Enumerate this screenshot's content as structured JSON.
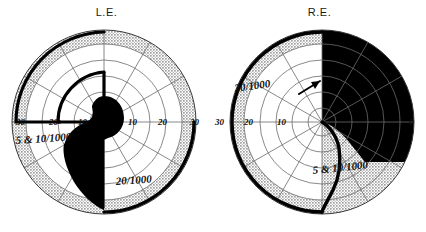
{
  "figure": {
    "kind": "visual-field-perimetry-pair",
    "background_color": "#ffffff",
    "ink_color": "#111111",
    "shade_color": "#c9c9c9",
    "grid_color": "#6b6b6b"
  },
  "panels": [
    {
      "id": "left-eye",
      "title": "L.E.",
      "center": {
        "cx": 104,
        "cy": 100
      },
      "outer_radius": 92,
      "grid": {
        "radial_rings": [
          14,
          30,
          46,
          62,
          78,
          92
        ],
        "meridian_count": 12,
        "shaded_annulus": [
          78,
          92
        ]
      },
      "axis_labels": [
        {
          "text": "30",
          "x": 16,
          "y": 103,
          "side": "left"
        },
        {
          "text": "20",
          "x": 49,
          "y": 103,
          "side": "left"
        },
        {
          "text": "10",
          "x": 78,
          "y": 103,
          "side": "left"
        },
        {
          "text": "10",
          "x": 128,
          "y": 103,
          "side": "right"
        },
        {
          "text": "20",
          "x": 158,
          "y": 103,
          "side": "right"
        },
        {
          "text": "30",
          "x": 190,
          "y": 103,
          "side": "right"
        }
      ],
      "isopter_labels": [
        {
          "text": "5 & 10/1000",
          "x": 16,
          "y": 122,
          "rotate": -4
        },
        {
          "text": "20/1000",
          "x": 116,
          "y": 163,
          "rotate": -4
        }
      ],
      "scotoma_fill": "#000000",
      "has_arrow": false
    },
    {
      "id": "right-eye",
      "title": "R.E.",
      "center": {
        "cx": 109,
        "cy": 100
      },
      "outer_radius": 92,
      "grid": {
        "radial_rings": [
          14,
          30,
          46,
          62,
          78,
          92
        ],
        "meridian_count": 12,
        "shaded_annulus": [
          78,
          92
        ]
      },
      "axis_labels": [
        {
          "text": "30",
          "x": 2,
          "y": 103,
          "side": "left"
        },
        {
          "text": "20",
          "x": 31,
          "y": 103,
          "side": "left"
        },
        {
          "text": "10",
          "x": 64,
          "y": 103,
          "side": "left"
        },
        {
          "text": "0",
          "x": 196,
          "y": 103,
          "side": "right"
        }
      ],
      "isopter_labels": [
        {
          "text": "20/1000",
          "x": 22,
          "y": 70,
          "rotate": -8
        },
        {
          "text": "5 & 10/1000",
          "x": 100,
          "y": 152,
          "rotate": -6
        }
      ],
      "scotoma_fill": "#000000",
      "has_arrow": true,
      "arrow": {
        "x1": 86,
        "y1": 72,
        "x2": 110,
        "y2": 58
      }
    }
  ]
}
